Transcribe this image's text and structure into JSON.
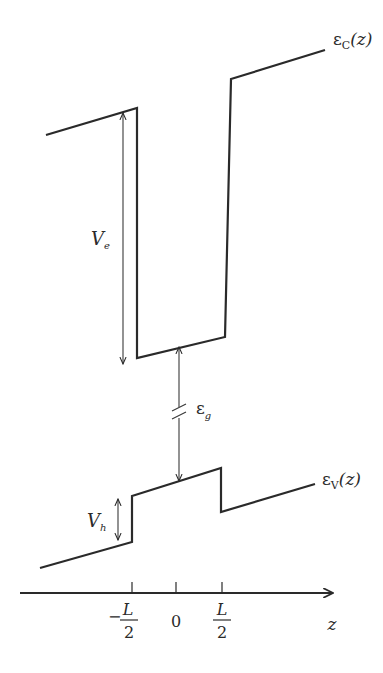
{
  "diagram": {
    "labels": {
      "conduction_band": "ε",
      "conduction_band_sub": "C",
      "conduction_band_arg": "(z)",
      "valence_band": "ε",
      "valence_band_sub": "V",
      "valence_band_arg": "(z)",
      "electron_offset": "V",
      "electron_offset_sub": "e",
      "hole_offset": "V",
      "hole_offset_sub": "h",
      "band_gap": "ε",
      "band_gap_sub": "g",
      "axis_variable": "z"
    },
    "axis_ticks": [
      {
        "minus": "−",
        "num": "L",
        "den": "2"
      },
      {
        "value": "0"
      },
      {
        "num": "L",
        "den": "2"
      }
    ],
    "colors": {
      "line": "#2a2a2a",
      "background": "#ffffff"
    }
  }
}
